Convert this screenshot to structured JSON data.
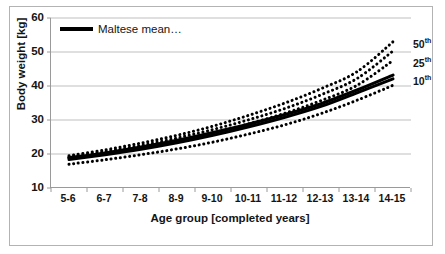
{
  "chart_data": {
    "type": "line",
    "title": "",
    "subtitle": "",
    "xlabel": "Age group [completed years]",
    "ylabel": "Body weight [kg]",
    "categories": [
      "5-6",
      "6-7",
      "7-8",
      "8-9",
      "9-10",
      "10-11",
      "11-12",
      "12-13",
      "13-14",
      "14-15"
    ],
    "ylim": [
      10,
      60
    ],
    "yticks": [
      10,
      20,
      30,
      40,
      50,
      60
    ],
    "grid": "horizontal",
    "legend_position": "top-left",
    "legend": [
      "Maltese mean…"
    ],
    "annotations": [
      {
        "text": "50",
        "sup": "th",
        "value": 53.0,
        "note": "label clipped at plot right edge"
      },
      {
        "text": "25",
        "sup": "th",
        "value": 47.5
      },
      {
        "text": "10",
        "sup": "th",
        "value": 42.0
      }
    ],
    "series": [
      {
        "name": "Maltese mean…",
        "style": "solid",
        "width": 3.2,
        "color": "#000000",
        "values": [
          18.9,
          20.3,
          22.0,
          24.0,
          26.3,
          28.8,
          31.6,
          34.8,
          38.8,
          43.2
        ]
      },
      {
        "name": "Maltese mean (second)",
        "style": "solid",
        "width": 3.0,
        "color": "#000000",
        "values": [
          18.4,
          19.8,
          21.4,
          23.3,
          25.5,
          28.0,
          30.8,
          34.0,
          38.0,
          42.1
        ]
      },
      {
        "name": "50th percentile upper",
        "style": "dotted",
        "width": 3.0,
        "color": "#000000",
        "values": [
          19.5,
          21.2,
          23.2,
          25.5,
          28.2,
          31.4,
          35.0,
          39.2,
          44.2,
          53.0
        ]
      },
      {
        "name": "50th percentile",
        "style": "dotted",
        "width": 3.0,
        "color": "#000000",
        "values": [
          19.1,
          20.7,
          22.5,
          24.7,
          27.2,
          30.1,
          33.4,
          37.4,
          42.2,
          50.3
        ]
      },
      {
        "name": "25th percentile",
        "style": "dotted",
        "width": 3.0,
        "color": "#000000",
        "values": [
          18.8,
          20.2,
          21.9,
          23.9,
          26.2,
          28.9,
          32.0,
          35.7,
          40.2,
          47.5
        ]
      },
      {
        "name": "10th percentile",
        "style": "dotted",
        "width": 3.0,
        "color": "#000000",
        "values": [
          17.0,
          18.3,
          19.8,
          21.5,
          23.5,
          25.9,
          28.6,
          31.9,
          35.8,
          40.2
        ]
      }
    ]
  },
  "legend": {
    "mean_label": "Maltese mean…"
  },
  "axes": {
    "y_title": "Body weight [kg]",
    "x_title": "Age group [completed years]"
  },
  "colors": {
    "ink": "#000000",
    "axis": "#9a9a9a",
    "grid": "#bfbfbf",
    "frame": "#b3b3b3",
    "background": "#ffffff"
  }
}
